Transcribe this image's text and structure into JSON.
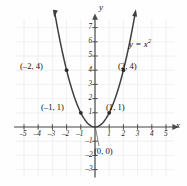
{
  "chart_data": {
    "type": "line",
    "title": "",
    "equation_label": "y = x²",
    "equation_base": "y = x",
    "equation_exp": "2",
    "xlabel": "x",
    "ylabel": "y",
    "xlim": [
      -5.8,
      5.8
    ],
    "ylim": [
      -3.6,
      7.9
    ],
    "grid": true,
    "legend": "none",
    "function": "y = x^2",
    "x_ticks": [
      -5,
      -4,
      -3,
      -2,
      -1,
      1,
      2,
      3,
      4,
      5
    ],
    "x_tick_labels": [
      "–5",
      "–4",
      "–3",
      "–2",
      "–1",
      "1",
      "2",
      "3",
      "4",
      "5"
    ],
    "y_ticks": [
      -3,
      -2,
      -1,
      1,
      2,
      3,
      4,
      5,
      6,
      7
    ],
    "y_tick_labels": [
      "–3",
      "–2",
      "–1",
      "1",
      "2",
      "3",
      "4",
      "5",
      "6",
      "7"
    ],
    "curve_x_range": [
      -2.83,
      2.83
    ],
    "points": [
      {
        "x": -2,
        "y": 4,
        "label": "(–2, 4)"
      },
      {
        "x": -1,
        "y": 1,
        "label": "(–1, 1)"
      },
      {
        "x": 0,
        "y": 0,
        "label": "(0, 0)"
      },
      {
        "x": 1,
        "y": 1,
        "label": "(1, 1)"
      },
      {
        "x": 2,
        "y": 4,
        "label": "(2, 4)"
      }
    ],
    "colors": {
      "curve": "#3f3f3f",
      "axis": "#4a4a4a",
      "grid": "#ececec",
      "text": "#111111",
      "background": "#fefefe",
      "point": "#2b2b2b"
    }
  },
  "labels": {
    "p_neg2_4": "(–2, 4)",
    "p_neg1_1": "(–1, 1)",
    "p_0_0": "(0, 0)",
    "p_1_1": "(1, 1)",
    "p_2_4": "(2, 4)",
    "x_axis": "x",
    "y_axis": "y",
    "eq_base": "y = x",
    "eq_exp": "2"
  },
  "ticks": {
    "xm5": "–5",
    "xm4": "–4",
    "xm3": "–3",
    "xm2": "–2",
    "xm1": "–1",
    "x1": "1",
    "x2": "2",
    "x3": "3",
    "x4": "4",
    "x5": "5",
    "y1": "1",
    "y2": "2",
    "y3": "3",
    "y4": "4",
    "y5": "5",
    "y6": "6",
    "y7": "7",
    "ym1": "–1",
    "ym2": "–2",
    "ym3": "–3"
  }
}
